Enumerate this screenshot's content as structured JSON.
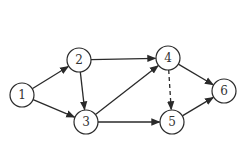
{
  "diagram": {
    "type": "directed-graph",
    "colors": {
      "stroke": "#2a2a2a",
      "node_fill": "#ffffff",
      "label": "#333333",
      "background": "#ffffff"
    },
    "nodes": [
      {
        "id": "1",
        "label": "1",
        "x": 22,
        "y": 95
      },
      {
        "id": "2",
        "label": "2",
        "x": 79,
        "y": 60
      },
      {
        "id": "3",
        "label": "3",
        "x": 86,
        "y": 122
      },
      {
        "id": "4",
        "label": "4",
        "x": 168,
        "y": 58
      },
      {
        "id": "5",
        "label": "5",
        "x": 172,
        "y": 122
      },
      {
        "id": "6",
        "label": "6",
        "x": 224,
        "y": 91
      }
    ],
    "edges": [
      {
        "from": "1",
        "to": "2",
        "style": "solid"
      },
      {
        "from": "1",
        "to": "3",
        "style": "solid"
      },
      {
        "from": "2",
        "to": "3",
        "style": "solid"
      },
      {
        "from": "2",
        "to": "4",
        "style": "solid"
      },
      {
        "from": "3",
        "to": "4",
        "style": "solid"
      },
      {
        "from": "3",
        "to": "5",
        "style": "solid"
      },
      {
        "from": "4",
        "to": "5",
        "style": "dashed"
      },
      {
        "from": "4",
        "to": "6",
        "style": "solid"
      },
      {
        "from": "5",
        "to": "6",
        "style": "solid"
      }
    ],
    "node_radius": 12
  }
}
